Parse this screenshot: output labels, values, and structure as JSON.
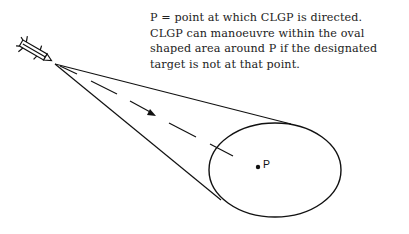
{
  "caption": {
    "lines": [
      "P  =  point at which CLGP is directed.",
      "CLGP can manoeuvre within the oval",
      "shaped area around P if the designated",
      "target is not at that point."
    ]
  },
  "diagram": {
    "point_label": "P",
    "icons": {
      "projectile": "missile-icon",
      "direction": "arrow-icon"
    },
    "colors": {
      "line": "#111111",
      "background": "#ffffff"
    }
  }
}
